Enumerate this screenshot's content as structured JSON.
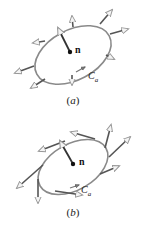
{
  "figure": {
    "panels": [
      {
        "id": "a",
        "caption": "(a)",
        "caption_letter": "a",
        "normal_label": "n",
        "curve_label_main": "C",
        "curve_label_sub": "a",
        "vectors_on_curve": "normal (outward, perpendicular to curve)"
      },
      {
        "id": "b",
        "caption": "(b)",
        "caption_letter": "b",
        "normal_label": "n",
        "curve_label_main": "C",
        "curve_label_sub": "a",
        "vectors_on_curve": "tangent (along curve)"
      }
    ],
    "colors": {
      "curve": "#8a8a8a",
      "vector": "#555555",
      "arrowhead": "#bbbbbb",
      "normal_vector": "#333333",
      "text": "#222222"
    }
  }
}
